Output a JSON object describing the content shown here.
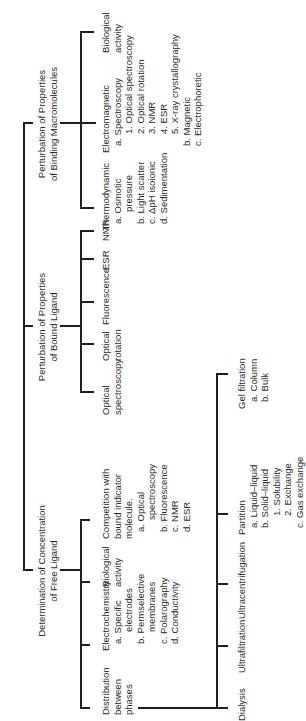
{
  "diagram": {
    "root": {
      "children": [
        {
          "title_line1": "Determination of Concentration",
          "title_line2": "of Free Ligand",
          "children": [
            {
              "line1": "Distribution",
              "line2": "between",
              "line3": "phases",
              "children": [
                "Dialysis",
                "Ultrafiltration",
                "Ultracentrifugation"
              ],
              "partition": {
                "title": "Partition",
                "a": "a.  Liquid–liquid",
                "b": "b.  Solid–liquid",
                "b1": "1. Solubility",
                "b2": "2. Exchange",
                "c": "c.  Gas exchange"
              },
              "gel": {
                "title": "Gel filtration",
                "a": "a.  Column",
                "b": "b.  Bulk"
              }
            },
            {
              "title": "Electrochemistry",
              "a": "a.  Specific",
              "a2": "electrodes",
              "b": "b.  Permselective",
              "b2": "membranes",
              "c": "c.  Polarography",
              "d": "d.  Conductivity"
            },
            {
              "line1": "Biological",
              "line2": "activity"
            },
            {
              "line1": "Competition with",
              "line2": "bound indicator",
              "line3": "molecule.",
              "a": "a.  Optical",
              "a2": "spectroscopy",
              "b": "b.  Fluorescence",
              "c": "c.  NMR",
              "d": "d.  ESR"
            }
          ]
        },
        {
          "title_line1": "Perturbation of Properties",
          "title_line2": "of Bound Ligand",
          "children": [
            {
              "line1": "Optical",
              "line2": "spectroscopy"
            },
            {
              "line1": "Optical",
              "line2": "rotation"
            },
            {
              "line1": "Fluorescence"
            },
            {
              "line1": "ESR"
            },
            {
              "line1": "NMR"
            }
          ]
        },
        {
          "title_line1": "Perturbation of Properties",
          "title_line2": "of Binding Macromolecules",
          "children": [
            {
              "title": "Thermodynamic",
              "a": "a.  Osmotic",
              "a2": "pressure",
              "b": "b.  Light scatter",
              "c": "c.  ΔpH isoionic",
              "d": "d.  Sedimentation"
            },
            {
              "title": "Electromagnetic",
              "a": "a.  Spectroscopy",
              "a1": "1. Optical spectroscopy",
              "a2": "2. Optical rotation",
              "a3": "3. NMR",
              "a4": "4. ESR",
              "a5": "5. X-ray crystallography",
              "b": "b.  Magnetic",
              "c": "c.  Electrophoretic"
            },
            {
              "line1": "Biological",
              "line2": "activity"
            }
          ]
        }
      ]
    }
  }
}
